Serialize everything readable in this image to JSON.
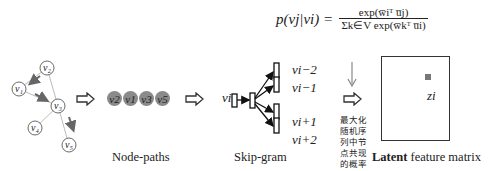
{
  "formula": {
    "lhs": "p(vj|vi) =",
    "numerator": "exp(w̅iᵀ u̅j)",
    "denominator": "Σk∈V exp(w̅kᵀ u̅i)"
  },
  "graph": {
    "nodes": [
      {
        "id": "v2",
        "label": "v2",
        "x": 47,
        "y": 68
      },
      {
        "id": "v1",
        "label": "v1",
        "x": 19,
        "y": 89
      },
      {
        "id": "v3",
        "label": "v3",
        "x": 58,
        "y": 106
      },
      {
        "id": "v4",
        "label": "v4",
        "x": 35,
        "y": 128
      },
      {
        "id": "v5",
        "label": "v5",
        "x": 69,
        "y": 145
      }
    ],
    "edges": [
      [
        "v2",
        "v1"
      ],
      [
        "v2",
        "v3"
      ],
      [
        "v1",
        "v3"
      ],
      [
        "v3",
        "v4"
      ],
      [
        "v3",
        "v5"
      ]
    ]
  },
  "node_paths": {
    "sequence": [
      "v2",
      "v1",
      "v3",
      "v5"
    ],
    "caption": "Node-paths"
  },
  "skip_gram": {
    "input_label": "vi",
    "context_labels": [
      "vi−2",
      "vi−1",
      "vi+1",
      "vi+2"
    ],
    "caption": "Skip-gram"
  },
  "objective": {
    "lines": [
      "最大化",
      "随机序",
      "列中节",
      "点共现",
      "的概率"
    ]
  },
  "matrix": {
    "point_label": "zi",
    "caption_bold": "Latent",
    "caption_rest": " feature matrix"
  }
}
